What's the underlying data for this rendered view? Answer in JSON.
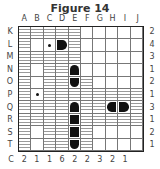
{
  "title": "Figure 14",
  "columns": [
    "A",
    "B",
    "C",
    "D",
    "E",
    "F",
    "G",
    "H",
    "I",
    "J"
  ],
  "rows": [
    "K",
    "L",
    "M",
    "N",
    "O",
    "P",
    "Q",
    "R",
    "S",
    "T"
  ],
  "row_clues": [
    "2",
    "4",
    "3",
    "1",
    "2",
    "1",
    "3",
    "1",
    "2",
    "1"
  ],
  "col_clues_label": "C",
  "col_clues": [
    "2",
    "1",
    "1",
    "6",
    "2",
    "2",
    "3",
    "2",
    "1"
  ],
  "grid": [
    [
      "W",
      "W",
      "W",
      "W",
      "W",
      "-",
      "-",
      "-",
      "-",
      "-"
    ],
    [
      "W",
      "-",
      "dot",
      "ship-right",
      "W",
      "-",
      "-",
      "-",
      "-",
      "-"
    ],
    [
      "W",
      "W",
      "W",
      "W",
      "W",
      "-",
      "-",
      "-",
      "-",
      "-"
    ],
    [
      "W",
      "-",
      "W",
      "W",
      "ship-top",
      "-",
      "-",
      "-",
      "-",
      "-"
    ],
    [
      "W",
      "-",
      "W",
      "W",
      "ship-bottom",
      "W",
      "-",
      "-",
      "-",
      "-"
    ],
    [
      "W",
      "dot",
      "W",
      "W",
      "W",
      "W",
      "W",
      "W",
      "W",
      "W"
    ],
    [
      "W",
      "W",
      "W",
      "W",
      "ship-top",
      "W",
      "W",
      "ship-left",
      "ship-right",
      "W"
    ],
    [
      "W",
      "W",
      "W",
      "W",
      "ship-mid",
      "W",
      "W",
      "W",
      "W",
      "W"
    ],
    [
      "W",
      "-",
      "W",
      "W",
      "ship-mid",
      "W",
      "-",
      "-",
      "-",
      "-"
    ],
    [
      "W",
      "-",
      "W",
      "W",
      "ship-bottom",
      "W",
      "-",
      "-",
      "-",
      "-"
    ]
  ],
  "legend": {
    "W": "water",
    "-": "empty",
    "dot": "water-marker",
    "ship-*": "ship segment"
  }
}
